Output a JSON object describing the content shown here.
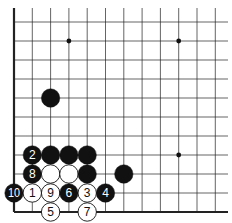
{
  "diagram": {
    "type": "go-board-diagram",
    "board": {
      "columns_visible": 12,
      "rows_visible": 11,
      "edges": [
        "left",
        "bottom"
      ],
      "line_color": "#222222",
      "edge_color": "#111111",
      "background": "#ffffff"
    },
    "star_points": [
      {
        "col": 3,
        "row": 9
      },
      {
        "col": 9,
        "row": 9
      },
      {
        "col": 9,
        "row": 3
      }
    ],
    "stones": [
      {
        "color": "black",
        "col": 2,
        "row": 6,
        "label": ""
      },
      {
        "color": "black",
        "col": 1,
        "row": 3,
        "label": "2"
      },
      {
        "color": "black",
        "col": 2,
        "row": 3,
        "label": ""
      },
      {
        "color": "black",
        "col": 3,
        "row": 3,
        "label": ""
      },
      {
        "color": "black",
        "col": 4,
        "row": 3,
        "label": ""
      },
      {
        "color": "black",
        "col": 1,
        "row": 2,
        "label": "8"
      },
      {
        "color": "white",
        "col": 2,
        "row": 2,
        "label": ""
      },
      {
        "color": "white",
        "col": 3,
        "row": 2,
        "label": ""
      },
      {
        "color": "black",
        "col": 4,
        "row": 2,
        "label": ""
      },
      {
        "color": "black",
        "col": 6,
        "row": 2,
        "label": ""
      },
      {
        "color": "black",
        "col": 0,
        "row": 1,
        "label": "10"
      },
      {
        "color": "white",
        "col": 1,
        "row": 1,
        "label": "1"
      },
      {
        "color": "white",
        "col": 2,
        "row": 1,
        "label": "9"
      },
      {
        "color": "black",
        "col": 3,
        "row": 1,
        "label": "6"
      },
      {
        "color": "white",
        "col": 4,
        "row": 1,
        "label": "3"
      },
      {
        "color": "black",
        "col": 5,
        "row": 1,
        "label": "4"
      },
      {
        "color": "white",
        "col": 2,
        "row": 0,
        "label": "5"
      },
      {
        "color": "white",
        "col": 4,
        "row": 0,
        "label": "7"
      }
    ]
  }
}
